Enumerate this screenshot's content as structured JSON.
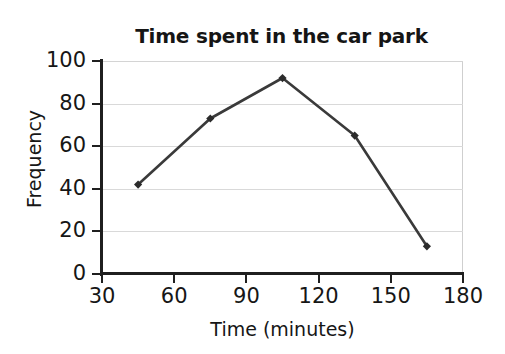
{
  "chart_data": {
    "type": "line",
    "title": "Time spent in the car park",
    "xlabel": "Time (minutes)",
    "ylabel": "Frequency",
    "x": [
      45,
      75,
      105,
      135,
      165
    ],
    "values": [
      42,
      73,
      92,
      65,
      13
    ],
    "series": [
      {
        "name": "Frequency",
        "x": [
          45,
          75,
          105,
          135,
          165
        ],
        "values": [
          42,
          73,
          92,
          65,
          13
        ]
      }
    ],
    "points": [
      {
        "x": 45,
        "y": 42
      },
      {
        "x": 75,
        "y": 73
      },
      {
        "x": 105,
        "y": 92
      },
      {
        "x": 135,
        "y": 65
      },
      {
        "x": 165,
        "y": 13
      }
    ],
    "xlim": [
      30,
      180
    ],
    "ylim": [
      0,
      100
    ],
    "x_ticks": [
      "30",
      "60",
      "90",
      "120",
      "150",
      "180"
    ],
    "y_ticks": [
      "0",
      "20",
      "40",
      "60",
      "80",
      "100"
    ],
    "x_tick_values": [
      30,
      60,
      90,
      120,
      150,
      180
    ],
    "y_tick_values": [
      0,
      20,
      40,
      60,
      80,
      100
    ],
    "grid": "horizontal",
    "legend": "none",
    "marker": "diamond",
    "line_color": "#3a3a3a",
    "marker_color": "#2b2b2b",
    "grid_color": "#d9d9d9",
    "axis_color": "#1f1f1f",
    "background": "#ffffff"
  }
}
